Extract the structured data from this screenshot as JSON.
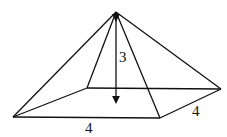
{
  "diagram": {
    "type": "square pyramid",
    "labels": {
      "height": "3",
      "base_front": "4",
      "base_side": "4"
    },
    "points": {
      "apex": [
        116,
        12
      ],
      "back_left": [
        87,
        88
      ],
      "back_right": [
        221,
        89
      ],
      "front_left": [
        13,
        117
      ],
      "front_right": [
        160,
        118
      ],
      "height_foot": [
        116,
        103
      ]
    },
    "line_color": "#111111"
  }
}
